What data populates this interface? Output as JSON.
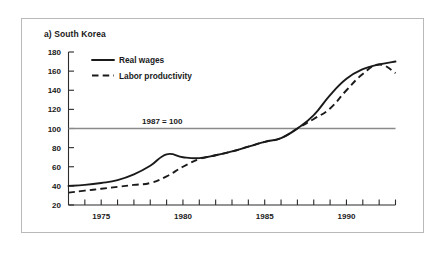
{
  "figure": {
    "panel_label": "a) South Korea",
    "note": "1987 = 100"
  },
  "chart_data": {
    "type": "line",
    "title": "a) South Korea",
    "xlabel": "",
    "ylabel": "",
    "xlim": [
      1973,
      1993
    ],
    "ylim": [
      20,
      180
    ],
    "ytick_labels": [
      "180",
      "160",
      "140",
      "120",
      "100",
      "80",
      "60",
      "40",
      "20"
    ],
    "yticks": [
      180,
      160,
      140,
      120,
      100,
      80,
      60,
      40,
      20
    ],
    "xtick_labels": [
      "1975",
      "1980",
      "1985",
      "1990"
    ],
    "xticks_major": [
      1975,
      1980,
      1985,
      1990
    ],
    "xticks_minor": [
      1974,
      1975,
      1976,
      1977,
      1978,
      1979,
      1980,
      1981,
      1982,
      1983,
      1984,
      1985,
      1986,
      1987,
      1988,
      1989,
      1990,
      1991,
      1992,
      1993
    ],
    "grid": false,
    "legend_position": "top-left inside",
    "annotations": [
      {
        "text": "1987 = 100",
        "x": 1977.5,
        "y": 105,
        "type": "reference-line-label"
      }
    ],
    "reference_line": {
      "y": 100,
      "label": "1987 = 100",
      "color": "#8a8a8a"
    },
    "x": [
      1973,
      1974,
      1975,
      1976,
      1977,
      1978,
      1979,
      1980,
      1981,
      1982,
      1983,
      1984,
      1985,
      1986,
      1987,
      1988,
      1989,
      1990,
      1991,
      1992,
      1993
    ],
    "series": [
      {
        "name": "Real wages",
        "style": "solid",
        "color": "#1a1a1a",
        "values": [
          40,
          41,
          43,
          46,
          52,
          61,
          73,
          70,
          69,
          72,
          76,
          81,
          86,
          90,
          100,
          114,
          135,
          152,
          162,
          167,
          170
        ]
      },
      {
        "name": "Labor productivity",
        "style": "dashed",
        "color": "#1a1a1a",
        "values": [
          33,
          35,
          37,
          39,
          41,
          43,
          50,
          60,
          68,
          72,
          76,
          81,
          86,
          90,
          100,
          110,
          121,
          140,
          157,
          167,
          158
        ]
      }
    ]
  },
  "legend": {
    "items": [
      {
        "label": "Real wages",
        "style": "solid"
      },
      {
        "label": "Labor productivity",
        "style": "dashed"
      }
    ]
  }
}
